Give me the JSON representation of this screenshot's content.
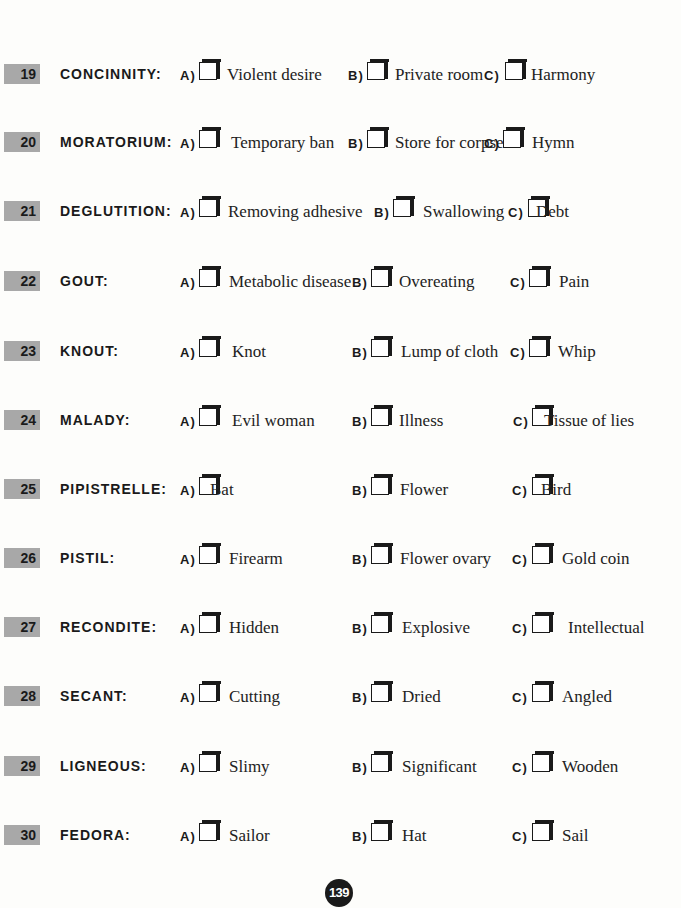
{
  "questions": [
    {
      "number": "19",
      "word": "CONCINNITY:",
      "options": [
        {
          "letter": "A)",
          "text": "Violent desire"
        },
        {
          "letter": "B)",
          "text": "Private room"
        },
        {
          "letter": "C)",
          "text": "Harmony"
        }
      ]
    },
    {
      "number": "20",
      "word": "MORATORIUM:",
      "options": [
        {
          "letter": "A)",
          "text": "Temporary ban"
        },
        {
          "letter": "B)",
          "text": "Store for corpses"
        },
        {
          "letter": "C)",
          "text": "Hymn"
        }
      ]
    },
    {
      "number": "21",
      "word": "DEGLUTITION:",
      "options": [
        {
          "letter": "A)",
          "text": "Removing adhesive"
        },
        {
          "letter": "B)",
          "text": "Swallowing"
        },
        {
          "letter": "C)",
          "text": "Debt"
        }
      ]
    },
    {
      "number": "22",
      "word": "GOUT:",
      "options": [
        {
          "letter": "A)",
          "text": "Metabolic disease"
        },
        {
          "letter": "B)",
          "text": "Overeating"
        },
        {
          "letter": "C)",
          "text": "Pain"
        }
      ]
    },
    {
      "number": "23",
      "word": "KNOUT:",
      "options": [
        {
          "letter": "A)",
          "text": "Knot"
        },
        {
          "letter": "B)",
          "text": "Lump of cloth"
        },
        {
          "letter": "C)",
          "text": "Whip"
        }
      ]
    },
    {
      "number": "24",
      "word": "MALADY:",
      "options": [
        {
          "letter": "A)",
          "text": "Evil woman"
        },
        {
          "letter": "B)",
          "text": "Illness"
        },
        {
          "letter": "C)",
          "text": "Tissue of lies"
        }
      ]
    },
    {
      "number": "25",
      "word": "PIPISTRELLE:",
      "options": [
        {
          "letter": "A)",
          "text": "Bat"
        },
        {
          "letter": "B)",
          "text": "Flower"
        },
        {
          "letter": "C)",
          "text": "Bird"
        }
      ]
    },
    {
      "number": "26",
      "word": "PISTIL:",
      "options": [
        {
          "letter": "A)",
          "text": "Firearm"
        },
        {
          "letter": "B)",
          "text": "Flower ovary"
        },
        {
          "letter": "C)",
          "text": "Gold coin"
        }
      ]
    },
    {
      "number": "27",
      "word": "RECONDITE:",
      "options": [
        {
          "letter": "A)",
          "text": "Hidden"
        },
        {
          "letter": "B)",
          "text": "Explosive"
        },
        {
          "letter": "C)",
          "text": "Intellectual"
        }
      ]
    },
    {
      "number": "28",
      "word": "SECANT:",
      "options": [
        {
          "letter": "A)",
          "text": "Cutting"
        },
        {
          "letter": "B)",
          "text": "Dried"
        },
        {
          "letter": "C)",
          "text": "Angled"
        }
      ]
    },
    {
      "number": "29",
      "word": "LIGNEOUS:",
      "options": [
        {
          "letter": "A)",
          "text": "Slimy"
        },
        {
          "letter": "B)",
          "text": "Significant"
        },
        {
          "letter": "C)",
          "text": "Wooden"
        }
      ]
    },
    {
      "number": "30",
      "word": "FEDORA:",
      "options": [
        {
          "letter": "A)",
          "text": "Sailor"
        },
        {
          "letter": "B)",
          "text": "Hat"
        },
        {
          "letter": "C)",
          "text": "Sail"
        }
      ]
    }
  ],
  "page_number": "139"
}
